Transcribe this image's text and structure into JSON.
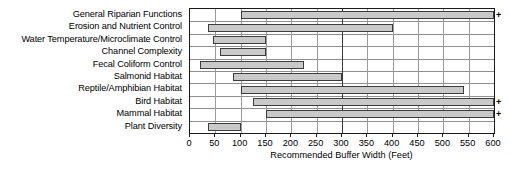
{
  "chart_data": {
    "type": "bar",
    "orientation": "horizontal",
    "title": "",
    "xlabel": "Recommended Buffer Width (Feet)",
    "ylabel": "",
    "xlim": [
      0,
      600
    ],
    "xticks": [
      0,
      50,
      100,
      150,
      200,
      250,
      300,
      350,
      400,
      450,
      500,
      550,
      600
    ],
    "xtick_labels": [
      "0",
      "50",
      "100",
      "150",
      "200",
      "250",
      "300",
      "350",
      "400",
      "450",
      "500",
      "550",
      "600"
    ],
    "grid": true,
    "legend": "none",
    "bar_style": {
      "fill": "#c9c9c9",
      "edge": "#3d3d3d"
    },
    "overflow_symbol": "+",
    "overflow_note": "bars marked + extend beyond 600 feet",
    "categories": [
      "General Riparian Functions",
      "Erosion and Nutrient Control",
      "Water Temperature/Microclimate Control",
      "Channel Complexity",
      "Fecal Coliform Control",
      "Salmonid Habitat",
      "Reptile/Amphibian Habitat",
      "Bird Habitat",
      "Mammal Habitat",
      "Plant Diversity"
    ],
    "bars": [
      {
        "category": "General Riparian Functions",
        "start": 100,
        "end": 600,
        "overflow": true
      },
      {
        "category": "Erosion and Nutrient Control",
        "start": 35,
        "end": 400,
        "overflow": false
      },
      {
        "category": "Water Temperature/Microclimate Control",
        "start": 45,
        "end": 150,
        "overflow": false
      },
      {
        "category": "Channel Complexity",
        "start": 60,
        "end": 150,
        "overflow": false
      },
      {
        "category": "Fecal Coliform Control",
        "start": 20,
        "end": 225,
        "overflow": false
      },
      {
        "category": "Salmonid Habitat",
        "start": 85,
        "end": 300,
        "overflow": false
      },
      {
        "category": "Reptile/Amphibian Habitat",
        "start": 100,
        "end": 540,
        "overflow": false
      },
      {
        "category": "Bird Habitat",
        "start": 125,
        "end": 600,
        "overflow": true
      },
      {
        "category": "Mammal Habitat",
        "start": 150,
        "end": 600,
        "overflow": true
      },
      {
        "category": "Plant Diversity",
        "start": 35,
        "end": 100,
        "overflow": false
      }
    ]
  }
}
